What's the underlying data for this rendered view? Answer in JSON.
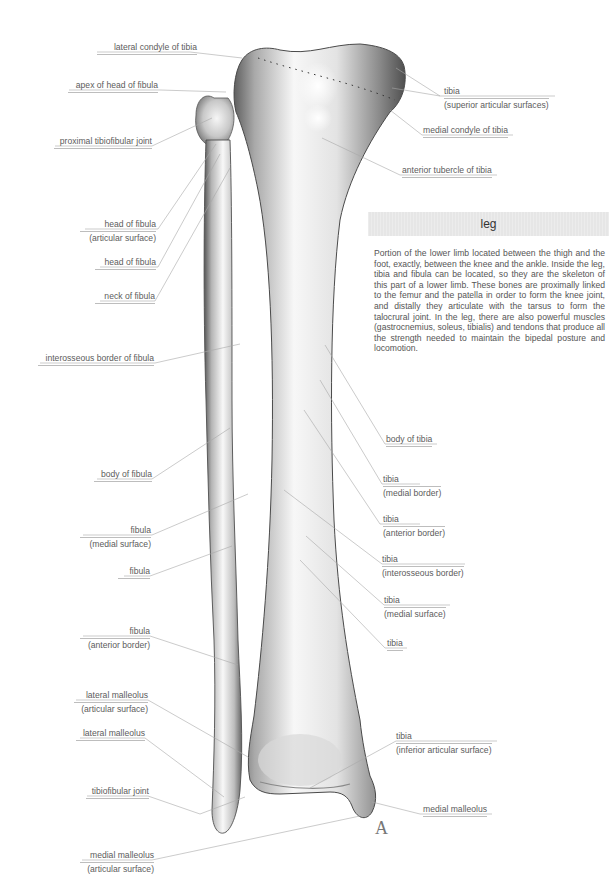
{
  "info_panel": {
    "title": "leg",
    "body": "Portion of the lower limb located between the thigh and the foot, exactly, between the knee and the ankle. Inside the leg, tibia and fibula can be located, so they are the skeleton of this part of a lower limb. These bones are proximally linked to the femur and the patella in order to form the knee joint, and distally they articulate with the tarsus to form the talocrural joint. In the leg, there are also powerful muscles (gastrocnemius, soleus, tibialis) and tendons that produce all the strength needed to maintain the bipedal posture and locomotion."
  },
  "figure_letter": "A",
  "colors": {
    "label_text": "#5c5c5c",
    "leader_line": "#a8a8a8",
    "header_bg": "#e6e6e6",
    "bone_light": "#f4f4f4",
    "bone_shade": "#6e6e6e"
  },
  "labels_left": [
    {
      "line1": "lateral condyle of tibia"
    },
    {
      "line1": "apex of head of fibula"
    },
    {
      "line1": "proximal tibiofibular joint"
    },
    {
      "line1": "head of fibula",
      "line2": "(articular surface)"
    },
    {
      "line1": "head of fibula"
    },
    {
      "line1": "neck of fibula"
    },
    {
      "line1": "interosseous border of fibula"
    },
    {
      "line1": "body of fibula"
    },
    {
      "line1": "fibula",
      "line2": "(medial surface)"
    },
    {
      "line1": "fibula"
    },
    {
      "line1": "fibula",
      "line2": "(anterior border)"
    },
    {
      "line1": "lateral malleolus",
      "line2": "(articular surface)"
    },
    {
      "line1": "lateral malleolus"
    },
    {
      "line1": "tibiofibular joint"
    },
    {
      "line1": "medial malleolus",
      "line2": "(articular surface)"
    }
  ],
  "labels_right": [
    {
      "line1": "tibia",
      "line2": "(superior articular surfaces)"
    },
    {
      "line1": "medial condyle of tibia"
    },
    {
      "line1": "anterior tubercle of tibia"
    },
    {
      "line1": "body of tibia"
    },
    {
      "line1": "tibia",
      "line2": "(medial border)"
    },
    {
      "line1": "tibia",
      "line2": "(anterior border)"
    },
    {
      "line1": "tibia",
      "line2": "(interosseous border)"
    },
    {
      "line1": "tibia",
      "line2": "(medial surface)"
    },
    {
      "line1": "tibia"
    },
    {
      "line1": "tibia",
      "line2": "(inferior articular surface)"
    },
    {
      "line1": "medial malleolus"
    }
  ]
}
